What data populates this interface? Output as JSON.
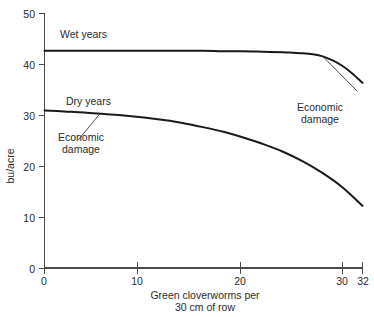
{
  "chart_data": {
    "type": "line",
    "title": "",
    "xlabel": "Green cloverworms per 30 cm of row",
    "xlabel_line1": "Green cloverworms per",
    "xlabel_line2": "30 cm of row",
    "ylabel": "bu/acre",
    "xlim": [
      0,
      32
    ],
    "ylim": [
      0,
      50
    ],
    "grid": false,
    "legend_position": "inline-annotations",
    "xticks": [
      0,
      10,
      20,
      30,
      32
    ],
    "xtick_labels": [
      "0",
      "10",
      "20",
      "30",
      "32"
    ],
    "yticks": [
      0,
      10,
      20,
      30,
      40,
      50
    ],
    "ytick_labels": [
      "0",
      "10",
      "20",
      "30",
      "40",
      "50"
    ],
    "series": [
      {
        "name": "Wet years",
        "label": "Wet years",
        "x": [
          0,
          2,
          4,
          6,
          8,
          10,
          12,
          14,
          16,
          18,
          20,
          22,
          24,
          25,
          26,
          27,
          28,
          29,
          30,
          31,
          32
        ],
        "values": [
          42.7,
          42.7,
          42.7,
          42.7,
          42.7,
          42.7,
          42.7,
          42.7,
          42.7,
          42.6,
          42.6,
          42.5,
          42.4,
          42.3,
          42.2,
          42.0,
          41.6,
          40.8,
          39.7,
          38.2,
          36.4
        ]
      },
      {
        "name": "Dry years",
        "label": "Dry years",
        "x": [
          0,
          2,
          4,
          6,
          8,
          10,
          12,
          14,
          16,
          18,
          20,
          22,
          24,
          26,
          28,
          30,
          32
        ],
        "values": [
          31.0,
          30.8,
          30.6,
          30.3,
          30.0,
          29.6,
          29.1,
          28.5,
          27.7,
          26.8,
          25.7,
          24.4,
          22.9,
          21.0,
          18.7,
          15.9,
          12.3
        ]
      }
    ],
    "annotations": [
      {
        "name": "economic-damage-wet",
        "line1": "Economic",
        "line2": "damage",
        "text": "Economic damage",
        "point_x": 28.0,
        "point_y": 41.6,
        "text_x": 31.5,
        "text_y": 34.7
      },
      {
        "name": "economic-damage-dry",
        "line1": "Economic",
        "line2": "damage",
        "text": "Economic damage",
        "point_x": 5.6,
        "point_y": 30.4,
        "text_x": 3.4,
        "text_y": 25.2
      }
    ]
  }
}
